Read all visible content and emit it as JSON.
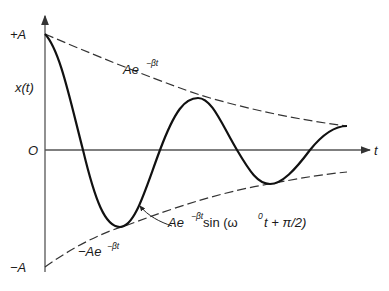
{
  "diagram": {
    "axes": {
      "y_label": "x(t)",
      "x_label": "t",
      "origin_label": "O",
      "top_label": "+A",
      "bottom_label": "−A"
    },
    "curves": {
      "upper_envelope_label": {
        "main": "Ae",
        "exp": "−βt"
      },
      "lower_envelope_label": {
        "main": "−Ae",
        "exp": "−βt"
      },
      "oscillation_label": {
        "main": "Ae",
        "exp": "−βt",
        "rest1": " sin (ω",
        "sup2": "0",
        "rest2": "t + π/2)"
      }
    },
    "key_points": {
      "start": [
        45,
        34
      ],
      "zero_crossings_x": [
        83,
        160,
        237,
        310
      ],
      "extrema": [
        [
          120,
          227
        ],
        [
          198,
          98
        ],
        [
          270,
          184
        ]
      ],
      "end": [
        347,
        126
      ]
    },
    "colors": {
      "curve": "#111111",
      "envelope": "#333333",
      "axis": "#555555"
    }
  }
}
